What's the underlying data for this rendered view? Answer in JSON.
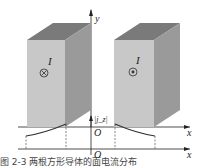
{
  "figure": {
    "top_axes": {
      "y_label": "y",
      "x_label": "x",
      "origin_label": "O"
    },
    "bottom_axes": {
      "y_label": "|j_z|",
      "x_label": "x",
      "origin_label": "O"
    },
    "left_block": {
      "current_label": "I",
      "current_direction": "into-page (⊗)"
    },
    "right_block": {
      "current_label": "I",
      "current_direction": "out-of-page (⊙)"
    },
    "colors": {
      "front_face": "#c8c8c8",
      "top_face": "#7a7a7a",
      "side_face": "#9a9a9a",
      "axis": "#222222",
      "curve": "#333333"
    },
    "caption": "图 2-3  两根方形导体的面电流分布"
  }
}
